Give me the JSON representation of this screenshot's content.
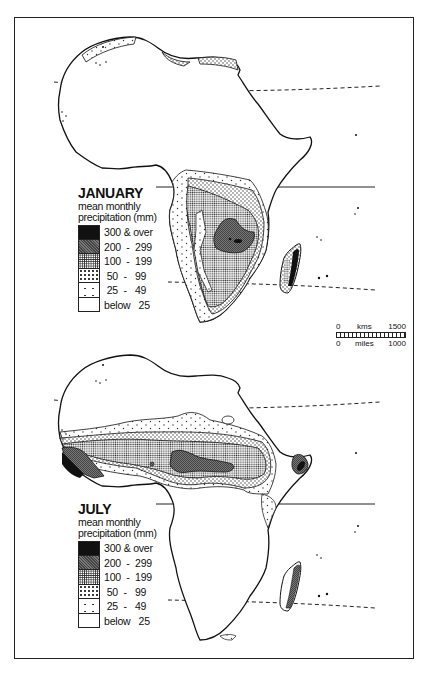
{
  "maps": [
    {
      "id": "january",
      "title": "JANUARY",
      "subtitle_line1": "mean monthly",
      "subtitle_line2": "precipitation (mm)",
      "legend": [
        {
          "range": "300 & over",
          "pattern": "solid-black"
        },
        {
          "range": "200  -  299",
          "pattern": "dark-stipple"
        },
        {
          "range": "100  -  199",
          "pattern": "dense-dots"
        },
        {
          "range": " 50  -   99",
          "pattern": "medium-dots"
        },
        {
          "range": " 25  -   49",
          "pattern": "sparse-dots"
        },
        {
          "range": "below   25",
          "pattern": "blank"
        }
      ]
    },
    {
      "id": "july",
      "title": "JULY",
      "subtitle_line1": "mean monthly",
      "subtitle_line2": "precipitation (mm)",
      "legend": [
        {
          "range": "300 & over",
          "pattern": "solid-black"
        },
        {
          "range": "200  -  299",
          "pattern": "dark-stipple"
        },
        {
          "range": "100  -  199",
          "pattern": "dense-dots"
        },
        {
          "range": " 50  -   99",
          "pattern": "medium-dots"
        },
        {
          "range": " 25  -   49",
          "pattern": "sparse-dots"
        },
        {
          "range": "below   25",
          "pattern": "blank"
        }
      ]
    }
  ],
  "scale": {
    "km_start": "0",
    "km_unit": "kms",
    "km_end": "1500",
    "mi_start": "0",
    "mi_unit": "miles",
    "mi_end": "1000"
  },
  "colors": {
    "ink": "#111111",
    "paper": "#ffffff"
  }
}
